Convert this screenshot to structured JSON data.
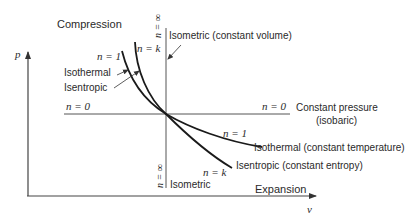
{
  "diagram": {
    "title_region": "Compression",
    "expansion_label": "Expansion",
    "axes": {
      "y_label": "p",
      "x_label": "v"
    },
    "processes": {
      "isometric": {
        "n_top": "n = ∞",
        "n_bottom": "n = ∞",
        "label_top": "Isometric (constant volume)",
        "label_bottom": "Isometric"
      },
      "isobaric": {
        "n_left": "n = 0",
        "n_right": "n = 0",
        "label_line1": "Constant pressure",
        "label_line2": "(isobaric)"
      },
      "isothermal": {
        "n_top": "n = 1",
        "n_bottom": "n = 1",
        "label_left": "Isothermal",
        "label_right": "Isothermal (constant temperature)"
      },
      "isentropic": {
        "n_top": "n = k",
        "n_bottom": "n = k",
        "label_left": "Isentropic",
        "label_right": "Isentropic (constant entropy)"
      }
    },
    "colors": {
      "line": "#1a1a1a",
      "axis": "#444444",
      "text": "#2a2a2a"
    }
  }
}
